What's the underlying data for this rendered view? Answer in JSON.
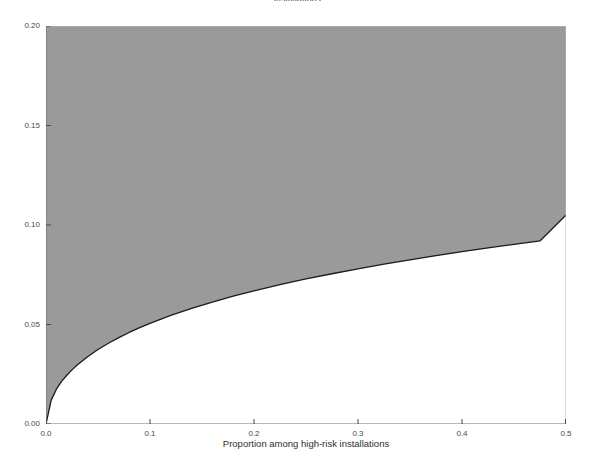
{
  "figure": {
    "title": "installations",
    "background": "#ffffff"
  },
  "annotation": {
    "text": "Detectable differences with 80-percent power"
  },
  "axes": {
    "x_label": "Proportion among high-risk installations",
    "y_label": "",
    "x_ticks": [
      "0.0",
      "0.1",
      "0.2",
      "0.3",
      "0.4",
      "0.5"
    ],
    "y_ticks": [
      "0.00",
      "0.05",
      "0.10",
      "0.15",
      "0.20"
    ]
  },
  "colors": {
    "fill": "#9a9a9a",
    "curve": "#1a1a1a",
    "frame": "#6f6f6f",
    "text": "#2b2b2b",
    "background": "#ffffff"
  },
  "chart_data": {
    "type": "area",
    "title": "installations",
    "xlabel": "Proportion among high-risk installations",
    "ylabel": "",
    "xlim": [
      0.0,
      0.5
    ],
    "ylim": [
      0.0,
      0.2
    ],
    "grid": false,
    "legend": null,
    "annotations": [
      {
        "text": "Detectable differences with 80-percent power",
        "x": 0.25,
        "y": 0.165
      }
    ],
    "x_ticks": [
      0.0,
      0.1,
      0.2,
      0.3,
      0.4,
      0.5
    ],
    "y_ticks": [
      0.0,
      0.05,
      0.1,
      0.15,
      0.2
    ],
    "series": [
      {
        "name": "Minimum detectable difference (80% power)",
        "fill_above": true,
        "fill_color": "#9a9a9a",
        "line_color": "#1a1a1a",
        "x": [
          0.0,
          0.005,
          0.01,
          0.015,
          0.02,
          0.025,
          0.03,
          0.04,
          0.05,
          0.06,
          0.07,
          0.08,
          0.09,
          0.1,
          0.12,
          0.14,
          0.16,
          0.18,
          0.2,
          0.225,
          0.25,
          0.275,
          0.3,
          0.325,
          0.35,
          0.375,
          0.4,
          0.425,
          0.45,
          0.475,
          0.5
        ],
        "y": [
          0.0,
          0.012,
          0.0175,
          0.0214,
          0.0245,
          0.0272,
          0.0296,
          0.0338,
          0.0374,
          0.0406,
          0.0434,
          0.046,
          0.0484,
          0.0506,
          0.0546,
          0.0581,
          0.0613,
          0.0642,
          0.0669,
          0.07,
          0.0729,
          0.0755,
          0.078,
          0.0803,
          0.0825,
          0.0846,
          0.0866,
          0.0885,
          0.0903,
          0.092,
          0.105
        ]
      }
    ]
  }
}
